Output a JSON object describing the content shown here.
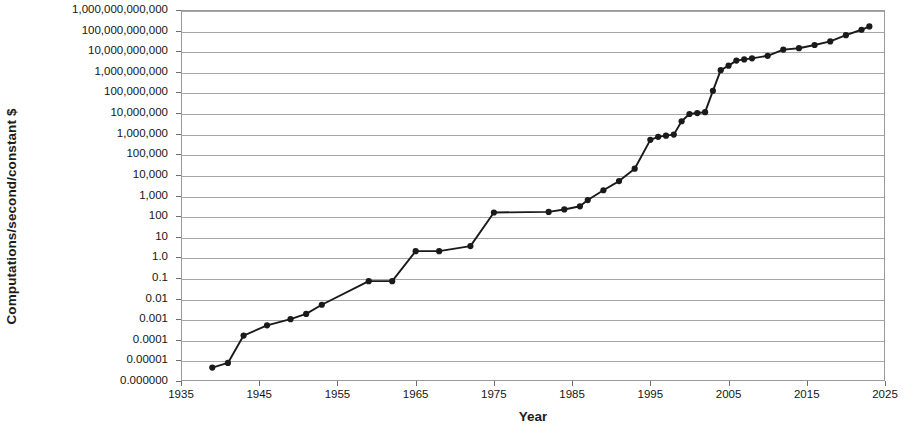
{
  "chart_data": {
    "type": "line",
    "title": "Moore's Law: The Fifth Paradigm",
    "xlabel": "Year",
    "ylabel": "Computations/second/constant $",
    "yscale": "log",
    "ylim": [
      1e-06,
      1000000000000
    ],
    "xlim": [
      1935,
      2025
    ],
    "grid": true,
    "legend": "none",
    "marker": "circle",
    "series_color": "#1a1a1a",
    "ytick_labels": [
      "1,000,000,000,000",
      "100,000,000,000",
      "10,000,000,000",
      "1,000,000,000",
      "100,000,000",
      "10,000,000",
      "1,000,000",
      "100,000",
      "10,000",
      "1,000",
      "100",
      "10",
      "1.0",
      "0.1",
      "0.01",
      "0.001",
      "0.0001",
      "0.00001",
      "0.000000"
    ],
    "ytick_values": [
      1000000000000.0,
      100000000000.0,
      10000000000.0,
      1000000000.0,
      100000000.0,
      10000000.0,
      1000000.0,
      100000.0,
      10000.0,
      1000.0,
      100,
      10,
      1,
      0.1,
      0.01,
      0.001,
      0.0001,
      1e-05,
      1e-06
    ],
    "xtick_labels": [
      "1935",
      "1945",
      "1955",
      "1965",
      "1975",
      "1985",
      "1995",
      "2005",
      "2015",
      "2025"
    ],
    "xtick_values": [
      1935,
      1945,
      1955,
      1965,
      1975,
      1985,
      1995,
      2005,
      2015,
      2025
    ],
    "x": [
      1939,
      1941,
      1943,
      1946,
      1949,
      1951,
      1953,
      1959,
      1962,
      1965,
      1968,
      1972,
      1975,
      1982,
      1984,
      1986,
      1987,
      1989,
      1991,
      1993,
      1995,
      1996,
      1997,
      1998,
      1999,
      2000,
      2001,
      2002,
      2003,
      2004,
      2005,
      2006,
      2007,
      2008,
      2010,
      2012,
      2014,
      2016,
      2018,
      2020,
      2022,
      2023
    ],
    "y": [
      4.5e-06,
      7.5e-06,
      0.00016,
      0.0005,
      0.001,
      0.0018,
      0.005,
      0.07,
      0.07,
      2.0,
      2.0,
      3.5,
      150,
      160,
      210,
      300,
      600,
      1800,
      5000,
      20000,
      500000,
      700000,
      800000,
      900000,
      4000000,
      9000000,
      10000000,
      11000000,
      120000000,
      1200000000,
      2000000000,
      3500000000,
      4000000000,
      4500000000,
      6000000000,
      12000000000,
      14000000000,
      20000000000,
      30000000000,
      60000000000,
      110000000000,
      160000000000
    ],
    "series_name": "Calculations per second per constant dollar"
  }
}
